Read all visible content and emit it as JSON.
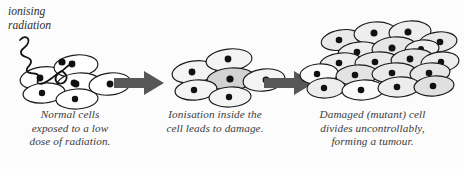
{
  "figure": {
    "background_color": "#fcfcfc"
  },
  "annotation": {
    "radiation_label_line1": "ionising",
    "radiation_label_line2": "radiation",
    "wave_name": "ionising-radiation-wave",
    "wave_color": "#111111"
  },
  "stages": [
    {
      "id": "normal",
      "caption_lines": [
        "Normal cells",
        "exposed to a low",
        "dose of radiation."
      ],
      "cell_count": 6,
      "cell_fill": "#ffffff",
      "cell_stroke": "#1a1a1a",
      "nucleus_color": "#111111",
      "cells": [
        {
          "cx": 42,
          "cy": 78,
          "rx": 22,
          "ry": 11,
          "rot": -8,
          "fill": "#ffffff",
          "nx": 40,
          "ny": 78,
          "nr": 3.4
        },
        {
          "cx": 76,
          "cy": 66,
          "rx": 22,
          "ry": 11,
          "rot": -6,
          "fill": "#ffffff",
          "nx": 72,
          "ny": 64,
          "nr": 3.4
        },
        {
          "cx": 79,
          "cy": 84,
          "rx": 22,
          "ry": 11,
          "rot": -4,
          "fill": "#ffffff",
          "nx": 76,
          "ny": 84,
          "nr": 3.4
        },
        {
          "cx": 44,
          "cy": 93,
          "rx": 21,
          "ry": 10,
          "rot": -5,
          "fill": "#ffffff",
          "nx": 42,
          "ny": 93,
          "nr": 3.2
        },
        {
          "cx": 77,
          "cy": 99,
          "rx": 21,
          "ry": 10,
          "rot": -3,
          "fill": "#ffffff",
          "nx": 75,
          "ny": 99,
          "nr": 3.2
        },
        {
          "cx": 110,
          "cy": 84,
          "rx": 21,
          "ry": 11,
          "rot": -7,
          "fill": "#ffffff",
          "nx": 110,
          "ny": 84,
          "nr": 3.4
        }
      ]
    },
    {
      "id": "ionised",
      "caption_lines": [
        "Ionisation inside the",
        "cell leads to damage."
      ],
      "cell_count": 6,
      "cell_fill": "#f3f3f3",
      "damaged_cell_fill": "#d2d2d2",
      "cell_stroke": "#1a1a1a",
      "nucleus_color": "#111111",
      "cells": [
        {
          "cx": 44,
          "cy": 72,
          "rx": 22,
          "ry": 11,
          "rot": -8,
          "fill": "#f4f4f4",
          "nx": 42,
          "ny": 72,
          "nr": 3.4
        },
        {
          "cx": 79,
          "cy": 60,
          "rx": 23,
          "ry": 11,
          "rot": -6,
          "fill": "#f4f4f4",
          "nx": 78,
          "ny": 59,
          "nr": 3.4
        },
        {
          "cx": 81,
          "cy": 79,
          "rx": 24,
          "ry": 11,
          "rot": -4,
          "fill": "#d2d2d2",
          "nx": 80,
          "ny": 79,
          "nr": 3.6
        },
        {
          "cx": 46,
          "cy": 90,
          "rx": 21,
          "ry": 10,
          "rot": -5,
          "fill": "#f4f4f4",
          "nx": 44,
          "ny": 90,
          "nr": 3.2
        },
        {
          "cx": 80,
          "cy": 97,
          "rx": 21,
          "ry": 10,
          "rot": -3,
          "fill": "#f4f4f4",
          "nx": 79,
          "ny": 97,
          "nr": 3.2
        },
        {
          "cx": 114,
          "cy": 80,
          "rx": 21,
          "ry": 11,
          "rot": -7,
          "fill": "#f4f4f4",
          "nx": 116,
          "ny": 80,
          "nr": 3.4
        }
      ]
    },
    {
      "id": "tumour",
      "caption_lines": [
        "Damaged (mutant) cell",
        "divides uncontrollably,",
        "forming a tumour."
      ],
      "cell_count": 19,
      "cell_fill": "#e8e8e8",
      "cell_stroke": "#1a1a1a",
      "nucleus_color": "#111111",
      "cells": [
        {
          "cx": 46,
          "cy": 40,
          "rx": 20,
          "ry": 10,
          "rot": -10,
          "fill": "#e9e9e9",
          "nx": 44,
          "ny": 40,
          "nr": 3.3
        },
        {
          "cx": 80,
          "cy": 33,
          "rx": 21,
          "ry": 11,
          "rot": -5,
          "fill": "#eeeeee",
          "nx": 79,
          "ny": 33,
          "nr": 3.5
        },
        {
          "cx": 115,
          "cy": 32,
          "rx": 21,
          "ry": 11,
          "rot": -4,
          "fill": "#eeeeee",
          "nx": 113,
          "ny": 32,
          "nr": 3.5
        },
        {
          "cx": 143,
          "cy": 42,
          "rx": 19,
          "ry": 10,
          "rot": -7,
          "fill": "#e9e9e9",
          "nx": 145,
          "ny": 42,
          "nr": 3.3
        },
        {
          "cx": 64,
          "cy": 52,
          "rx": 21,
          "ry": 10,
          "rot": -6,
          "fill": "#eeeeee",
          "nx": 62,
          "ny": 52,
          "nr": 3.3
        },
        {
          "cx": 99,
          "cy": 48,
          "rx": 22,
          "ry": 11,
          "rot": -5,
          "fill": "#e6e6e6",
          "nx": 97,
          "ny": 48,
          "nr": 3.5
        },
        {
          "cx": 127,
          "cy": 49,
          "rx": 17,
          "ry": 9,
          "rot": -6,
          "fill": "#ededed",
          "nx": 126,
          "ny": 49,
          "nr": 3.0
        },
        {
          "cx": 46,
          "cy": 63,
          "rx": 21,
          "ry": 10,
          "rot": -6,
          "fill": "#ededed",
          "nx": 44,
          "ny": 63,
          "nr": 3.3
        },
        {
          "cx": 82,
          "cy": 62,
          "rx": 22,
          "ry": 10,
          "rot": -4,
          "fill": "#e9e9e9",
          "nx": 80,
          "ny": 62,
          "nr": 3.3
        },
        {
          "cx": 117,
          "cy": 59,
          "rx": 21,
          "ry": 10,
          "rot": -5,
          "fill": "#e6e6e6",
          "nx": 115,
          "ny": 59,
          "nr": 3.4
        },
        {
          "cx": 145,
          "cy": 62,
          "rx": 19,
          "ry": 10,
          "rot": -6,
          "fill": "#ededed",
          "nx": 146,
          "ny": 62,
          "nr": 3.2
        },
        {
          "cx": 24,
          "cy": 74,
          "rx": 19,
          "ry": 10,
          "rot": -5,
          "fill": "#fafafa",
          "nx": 22,
          "ny": 74,
          "nr": 3.2
        },
        {
          "cx": 62,
          "cy": 75,
          "rx": 21,
          "ry": 10,
          "rot": -4,
          "fill": "#e3e3e3",
          "nx": 60,
          "ny": 75,
          "nr": 3.3
        },
        {
          "cx": 99,
          "cy": 73,
          "rx": 22,
          "ry": 10,
          "rot": -4,
          "fill": "#e9e9e9",
          "nx": 97,
          "ny": 73,
          "nr": 3.3
        },
        {
          "cx": 135,
          "cy": 73,
          "rx": 20,
          "ry": 10,
          "rot": -5,
          "fill": "#e6e6e6",
          "nx": 134,
          "ny": 73,
          "nr": 3.3
        },
        {
          "cx": 31,
          "cy": 88,
          "rx": 19,
          "ry": 10,
          "rot": -4,
          "fill": "#ededed",
          "nx": 29,
          "ny": 88,
          "nr": 3.2
        },
        {
          "cx": 68,
          "cy": 90,
          "rx": 21,
          "ry": 10,
          "rot": -3,
          "fill": "#fafafa",
          "nx": 66,
          "ny": 90,
          "nr": 3.3
        },
        {
          "cx": 104,
          "cy": 87,
          "rx": 21,
          "ry": 10,
          "rot": -4,
          "fill": "#ededed",
          "nx": 102,
          "ny": 87,
          "nr": 3.3
        },
        {
          "cx": 139,
          "cy": 86,
          "rx": 20,
          "ry": 10,
          "rot": -5,
          "fill": "#e0e0e0",
          "nx": 138,
          "ny": 86,
          "nr": 3.3
        }
      ]
    }
  ],
  "arrows": [
    {
      "id": "arrow-1",
      "name": "process-arrow-1",
      "color": "#575757"
    },
    {
      "id": "arrow-2",
      "name": "process-arrow-2",
      "color": "#575757"
    }
  ]
}
